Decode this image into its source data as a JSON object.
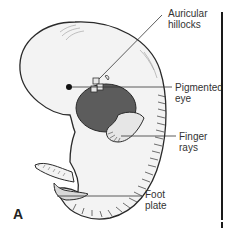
{
  "figure": {
    "panel_letter": "A",
    "labels": [
      {
        "id": "auricular-hillocks",
        "line1": "Auricular",
        "line2": "hillocks"
      },
      {
        "id": "pigmented-eye",
        "line1": "Pigmented",
        "line2": "eye"
      },
      {
        "id": "finger-rays",
        "line1": "Finger",
        "line2": "rays"
      },
      {
        "id": "foot-plate",
        "line1": "Foot",
        "line2": "plate"
      }
    ],
    "colors": {
      "line": "#333333",
      "outline": "#2a2a2a",
      "heart": "#5a5a5a",
      "body_fill": "#f2f2f2"
    }
  }
}
